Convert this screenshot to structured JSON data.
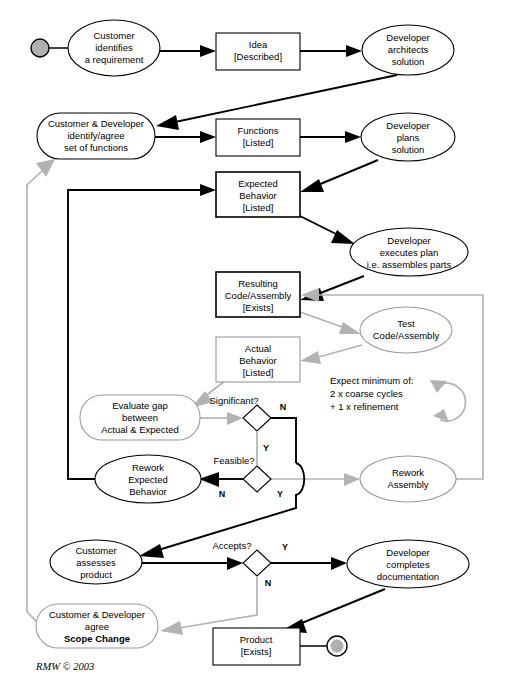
{
  "diagram": {
    "credit": "RMW © 2003",
    "colors": {
      "black": "#000000",
      "gray": "#b3b3b3",
      "shape_gray": "#9a9a9a",
      "terminator_fill": "#b0b0b0",
      "background": "#ffffff"
    },
    "nodes": {
      "start": {
        "name": "start-terminator",
        "label": ""
      },
      "end": {
        "name": "end-terminator",
        "label": ""
      },
      "customer_identifies": {
        "lines": [
          "Customer",
          "identifies",
          "a requirement"
        ]
      },
      "idea": {
        "lines": [
          "Idea",
          "[Described]"
        ]
      },
      "developer_architects": {
        "lines": [
          "Developer",
          "architects",
          "solution"
        ]
      },
      "cust_dev_functions": {
        "lines": [
          "Customer & Developer",
          "identify/agree",
          "set of functions"
        ]
      },
      "functions": {
        "lines": [
          "Functions",
          "[Listed]"
        ]
      },
      "developer_plans": {
        "lines": [
          "Developer",
          "plans",
          "solution"
        ]
      },
      "expected_behavior": {
        "lines": [
          "Expected",
          "Behavior",
          "[Listed]"
        ]
      },
      "developer_executes": {
        "lines": [
          "Developer",
          "executes plan",
          "i.e. assembles parts"
        ]
      },
      "resulting_code": {
        "lines": [
          "Resulting",
          "Code/Assembly",
          "[Exists]"
        ]
      },
      "test_code": {
        "lines": [
          "Test",
          "Code/Assembly"
        ]
      },
      "actual_behavior": {
        "lines": [
          "Actual",
          "Behavior",
          "[Listed]"
        ]
      },
      "evaluate_gap": {
        "lines": [
          "Evaluate gap",
          "between",
          "Actual & Expected"
        ]
      },
      "rework_expected": {
        "lines": [
          "Rework",
          "Expected",
          "Behavior"
        ]
      },
      "rework_assembly": {
        "lines": [
          "Rework",
          "Assembly"
        ]
      },
      "customer_assesses": {
        "lines": [
          "Customer",
          "assesses",
          "product"
        ]
      },
      "developer_completes": {
        "lines": [
          "Developer",
          "completes",
          "documentation"
        ]
      },
      "scope_change": {
        "lines": [
          "Customer & Developer",
          "agree"
        ],
        "bold_line": "Scope Change"
      },
      "product": {
        "lines": [
          "Product",
          "[Exists]"
        ]
      }
    },
    "decisions": {
      "significant": {
        "label": "Significant?",
        "yes": "Y",
        "no": "N"
      },
      "feasible": {
        "label": "Feasible?",
        "yes": "Y",
        "no": "N"
      },
      "accepts": {
        "label": "Accepts?",
        "yes": "Y",
        "no": "N"
      }
    },
    "note": {
      "lines": [
        "Expect minimum of:",
        "2 x coarse cycles",
        "+ 1 x refinement"
      ]
    }
  }
}
